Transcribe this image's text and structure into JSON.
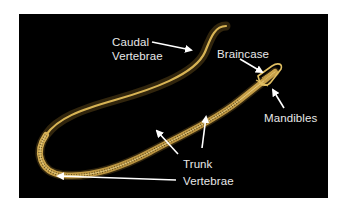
{
  "figure": {
    "background_color": "#000000",
    "page_color": "#ffffff",
    "skeleton_color": "#c9a24a",
    "arrow_color": "#ffffff",
    "label_color": "#e8e8e8"
  },
  "labels": {
    "caudal": {
      "line1": "Caudal",
      "line2": "Vertebrae"
    },
    "braincase": "Braincase",
    "mandibles": "Mandibles",
    "trunk": {
      "line1": "Trunk",
      "line2": "Vertebrae"
    }
  }
}
